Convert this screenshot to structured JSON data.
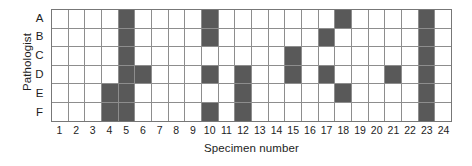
{
  "chart_data": {
    "type": "heatmap",
    "title": "",
    "xlabel": "Specimen number",
    "ylabel": "Pathologist",
    "grid": true,
    "legend": "none",
    "categories": [
      "1",
      "2",
      "3",
      "4",
      "5",
      "6",
      "7",
      "8",
      "9",
      "10",
      "11",
      "12",
      "13",
      "14",
      "15",
      "16",
      "17",
      "18",
      "19",
      "20",
      "21",
      "22",
      "23",
      "24"
    ],
    "row_labels": [
      "A",
      "B",
      "C",
      "D",
      "E",
      "F"
    ],
    "value_meaning": {
      "1": "filled (abnormality recorded)",
      "0": "empty (no abnormality recorded)"
    },
    "colors": {
      "filled": "#595959",
      "empty": "#ffffff",
      "gridline": "#8d8d8d",
      "border": "#777777"
    },
    "series": [
      {
        "name": "A",
        "values": [
          0,
          0,
          0,
          0,
          1,
          0,
          0,
          0,
          0,
          1,
          0,
          0,
          0,
          0,
          0,
          0,
          0,
          1,
          0,
          0,
          0,
          0,
          1,
          0
        ]
      },
      {
        "name": "B",
        "values": [
          0,
          0,
          0,
          0,
          1,
          0,
          0,
          0,
          0,
          1,
          0,
          0,
          0,
          0,
          0,
          0,
          1,
          0,
          0,
          0,
          0,
          0,
          1,
          0
        ]
      },
      {
        "name": "C",
        "values": [
          0,
          0,
          0,
          0,
          1,
          0,
          0,
          0,
          0,
          0,
          0,
          0,
          0,
          0,
          1,
          0,
          0,
          0,
          0,
          0,
          0,
          0,
          1,
          0
        ]
      },
      {
        "name": "D",
        "values": [
          0,
          0,
          0,
          0,
          1,
          1,
          0,
          0,
          0,
          1,
          0,
          1,
          0,
          0,
          1,
          0,
          1,
          0,
          0,
          0,
          1,
          0,
          1,
          0
        ]
      },
      {
        "name": "E",
        "values": [
          0,
          0,
          0,
          1,
          1,
          0,
          0,
          0,
          0,
          0,
          0,
          1,
          0,
          0,
          0,
          0,
          0,
          1,
          0,
          0,
          0,
          0,
          1,
          0
        ]
      },
      {
        "name": "F",
        "values": [
          0,
          0,
          0,
          1,
          1,
          0,
          0,
          0,
          0,
          1,
          0,
          1,
          0,
          0,
          0,
          0,
          0,
          0,
          0,
          0,
          0,
          0,
          1,
          0
        ]
      }
    ],
    "column_totals": [
      0,
      0,
      0,
      2,
      6,
      1,
      0,
      0,
      0,
      4,
      0,
      3,
      0,
      0,
      2,
      0,
      2,
      2,
      0,
      0,
      1,
      0,
      6,
      0
    ],
    "row_totals": [
      4,
      4,
      3,
      7,
      4,
      4
    ]
  }
}
